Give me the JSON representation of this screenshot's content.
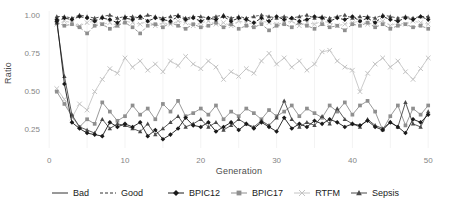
{
  "chart_data": {
    "type": "line",
    "title": "",
    "xlabel": "Generation",
    "ylabel": "Ratio",
    "x_ticks": [
      0,
      10,
      20,
      30,
      40,
      50
    ],
    "y_ticks": [
      0.25,
      0.5,
      0.75,
      1.0
    ],
    "y_tick_labels": [
      "0.25",
      "0.50",
      "0.75",
      "1.00"
    ],
    "xlim": [
      0,
      51
    ],
    "ylim": [
      0.15,
      1.02
    ],
    "grid": "faint-vertical",
    "legend_position": "bottom",
    "x": [
      1,
      2,
      3,
      4,
      5,
      6,
      7,
      8,
      9,
      10,
      11,
      12,
      13,
      14,
      15,
      16,
      17,
      18,
      19,
      20,
      21,
      22,
      23,
      24,
      25,
      26,
      27,
      28,
      29,
      30,
      31,
      32,
      33,
      34,
      35,
      36,
      37,
      38,
      39,
      40,
      41,
      42,
      43,
      44,
      45,
      46,
      47,
      48,
      49,
      50
    ],
    "series": [
      {
        "name": "Bad RTFM",
        "quality": "Bad",
        "dataset": "RTFM",
        "linetype": "solid",
        "marker": "x",
        "color": "#c4c4c4",
        "values": [
          0.52,
          0.45,
          0.33,
          0.42,
          0.38,
          0.5,
          0.58,
          0.65,
          0.62,
          0.72,
          0.66,
          0.7,
          0.64,
          0.68,
          0.63,
          0.7,
          0.67,
          0.73,
          0.68,
          0.65,
          0.7,
          0.66,
          0.58,
          0.63,
          0.6,
          0.65,
          0.62,
          0.7,
          0.75,
          0.68,
          0.72,
          0.66,
          0.7,
          0.64,
          0.68,
          0.76,
          0.77,
          0.7,
          0.66,
          0.64,
          0.5,
          0.62,
          0.68,
          0.72,
          0.66,
          0.7,
          0.63,
          0.58,
          0.65,
          0.72
        ]
      },
      {
        "name": "Good RTFM",
        "quality": "Good",
        "dataset": "RTFM",
        "linetype": "dashed",
        "marker": "x",
        "color": "#c4c4c4",
        "values": [
          0.94,
          0.96,
          0.95,
          0.93,
          0.95,
          0.96,
          0.94,
          0.95,
          0.93,
          0.96,
          0.95,
          0.94,
          0.96,
          0.93,
          0.95,
          0.94,
          0.96,
          0.95,
          0.93,
          0.95,
          0.96,
          0.94,
          0.95,
          0.93,
          0.96,
          0.95,
          0.94,
          0.96,
          0.95,
          0.94,
          0.95,
          0.96,
          0.93,
          0.95,
          0.94,
          0.96,
          0.95,
          0.93,
          0.94,
          0.95,
          0.96,
          0.94,
          0.95,
          0.96,
          0.93,
          0.95,
          0.94,
          0.96,
          0.95,
          0.94
        ]
      },
      {
        "name": "Bad BPIC17",
        "quality": "Bad",
        "dataset": "BPIC17",
        "linetype": "solid",
        "marker": "square",
        "color": "#8f8f8f",
        "values": [
          0.5,
          0.42,
          0.34,
          0.27,
          0.32,
          0.29,
          0.43,
          0.37,
          0.31,
          0.34,
          0.41,
          0.35,
          0.39,
          0.32,
          0.42,
          0.37,
          0.44,
          0.34,
          0.36,
          0.39,
          0.35,
          0.41,
          0.32,
          0.37,
          0.34,
          0.39,
          0.36,
          0.32,
          0.38,
          0.34,
          0.37,
          0.41,
          0.34,
          0.39,
          0.36,
          0.33,
          0.41,
          0.37,
          0.43,
          0.35,
          0.41,
          0.44,
          0.37,
          0.25,
          0.34,
          0.41,
          0.28,
          0.39,
          0.35,
          0.41
        ]
      },
      {
        "name": "Good BPIC17",
        "quality": "Good",
        "dataset": "BPIC17",
        "linetype": "dashed",
        "marker": "square",
        "color": "#8f8f8f",
        "values": [
          0.95,
          0.93,
          0.94,
          0.92,
          0.88,
          0.93,
          0.94,
          0.91,
          0.93,
          0.95,
          0.92,
          0.88,
          0.93,
          0.94,
          0.92,
          0.95,
          0.93,
          0.91,
          0.94,
          0.92,
          0.93,
          0.95,
          0.92,
          0.94,
          0.91,
          0.93,
          0.92,
          0.94,
          0.9,
          0.93,
          0.94,
          0.92,
          0.95,
          0.93,
          0.91,
          0.94,
          0.92,
          0.93,
          0.9,
          0.94,
          0.93,
          0.95,
          0.92,
          0.94,
          0.91,
          0.93,
          0.94,
          0.92,
          0.93,
          0.91
        ]
      },
      {
        "name": "Bad Sepsis",
        "quality": "Bad",
        "dataset": "Sepsis",
        "linetype": "solid",
        "marker": "triangle",
        "color": "#4a4a4a",
        "values": [
          0.95,
          0.6,
          0.35,
          0.27,
          0.25,
          0.23,
          0.32,
          0.26,
          0.29,
          0.28,
          0.26,
          0.24,
          0.29,
          0.22,
          0.26,
          0.3,
          0.34,
          0.27,
          0.29,
          0.32,
          0.27,
          0.3,
          0.25,
          0.28,
          0.32,
          0.29,
          0.27,
          0.31,
          0.28,
          0.33,
          0.44,
          0.32,
          0.27,
          0.3,
          0.28,
          0.34,
          0.29,
          0.39,
          0.32,
          0.29,
          0.27,
          0.32,
          0.28,
          0.26,
          0.3,
          0.27,
          0.43,
          0.29,
          0.27,
          0.37
        ]
      },
      {
        "name": "Good Sepsis",
        "quality": "Good",
        "dataset": "Sepsis",
        "linetype": "dashed",
        "marker": "triangle",
        "color": "#4a4a4a",
        "values": [
          0.99,
          0.99,
          0.98,
          1.0,
          0.99,
          0.98,
          0.99,
          1.0,
          0.98,
          0.99,
          0.99,
          0.98,
          1.0,
          0.99,
          0.98,
          0.99,
          1.0,
          0.98,
          0.99,
          0.99,
          0.98,
          0.99,
          1.0,
          0.98,
          0.99,
          0.98,
          0.99,
          1.0,
          0.99,
          0.98,
          0.99,
          0.98,
          0.99,
          1.0,
          0.98,
          0.99,
          0.98,
          0.99,
          1.0,
          0.98,
          0.99,
          0.99,
          0.98,
          1.0,
          0.99,
          0.98,
          0.99,
          0.98,
          0.99,
          0.99
        ]
      },
      {
        "name": "Bad BPIC12",
        "quality": "Bad",
        "dataset": "BPIC12",
        "linetype": "solid",
        "marker": "diamond",
        "color": "#1a1a1a",
        "values": [
          0.97,
          0.55,
          0.3,
          0.26,
          0.23,
          0.22,
          0.21,
          0.3,
          0.27,
          0.29,
          0.27,
          0.3,
          0.21,
          0.25,
          0.19,
          0.22,
          0.26,
          0.33,
          0.28,
          0.27,
          0.3,
          0.24,
          0.27,
          0.3,
          0.25,
          0.29,
          0.26,
          0.3,
          0.27,
          0.24,
          0.33,
          0.26,
          0.29,
          0.27,
          0.31,
          0.29,
          0.32,
          0.3,
          0.27,
          0.29,
          0.28,
          0.31,
          0.27,
          0.25,
          0.3,
          0.27,
          0.23,
          0.32,
          0.3,
          0.35
        ]
      },
      {
        "name": "Good BPIC12",
        "quality": "Good",
        "dataset": "BPIC12",
        "linetype": "dashed",
        "marker": "diamond",
        "color": "#1a1a1a",
        "values": [
          0.96,
          0.98,
          0.97,
          0.99,
          0.98,
          0.96,
          0.98,
          0.97,
          0.95,
          0.98,
          0.97,
          0.99,
          0.96,
          0.98,
          0.97,
          0.96,
          0.99,
          0.97,
          0.98,
          0.96,
          0.98,
          0.97,
          0.99,
          0.96,
          0.98,
          0.97,
          0.95,
          0.98,
          0.96,
          0.99,
          0.97,
          0.98,
          0.96,
          0.97,
          0.99,
          0.98,
          0.96,
          0.98,
          0.97,
          0.99,
          0.96,
          0.98,
          0.95,
          0.99,
          0.97,
          0.96,
          0.98,
          0.97,
          0.99,
          0.97
        ]
      }
    ],
    "legend": {
      "linetype_items": [
        {
          "label": "Bad",
          "linetype": "solid"
        },
        {
          "label": "Good",
          "linetype": "dashed"
        }
      ],
      "dataset_items": [
        {
          "label": "BPIC12",
          "marker": "diamond",
          "color": "#1a1a1a"
        },
        {
          "label": "BPIC17",
          "marker": "square",
          "color": "#8f8f8f"
        },
        {
          "label": "RTFM",
          "marker": "x",
          "color": "#c4c4c4"
        },
        {
          "label": "Sepsis",
          "marker": "triangle",
          "color": "#4a4a4a"
        }
      ]
    },
    "colors": {
      "tick_label": "#858585",
      "axis_title": "#4d4d4d",
      "legend_text": "#1a1a1a",
      "gridline": "#f3f3f3",
      "background": "#ffffff"
    }
  }
}
